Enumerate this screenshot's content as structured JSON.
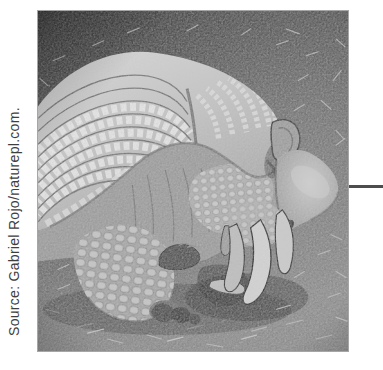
{
  "figure": {
    "credit": "Source: Gabriel Rojo/naturepl.com."
  },
  "colors": {
    "page_background": "#ffffff",
    "credit_text": "#3e3e3e",
    "photo_border": "#a6a6a6",
    "leader_line": "#4d4d4d"
  }
}
